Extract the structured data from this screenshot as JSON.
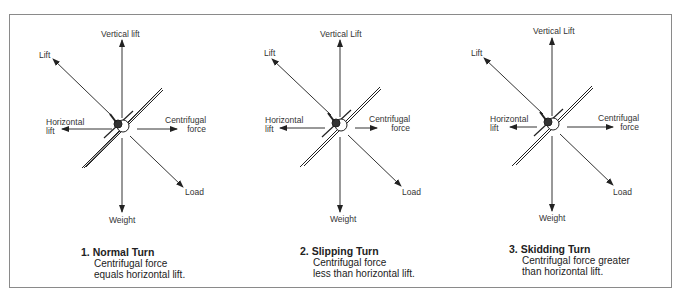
{
  "panels": [
    {
      "number": "1.",
      "title": "Normal Turn",
      "desc1": "Centrifugal force",
      "desc2": "equals horizontal lift.",
      "labels": {
        "vertical": "Vertical lift",
        "lift": "Lift",
        "h1": "Horizontal",
        "h2": "lift",
        "c1": "Centrifugal",
        "c2": "force",
        "load": "Load",
        "weight": "Weight"
      }
    },
    {
      "number": "2.",
      "title": "Slipping Turn",
      "desc1": "Centrifugal force",
      "desc2": "less than horizontal lift.",
      "labels": {
        "vertical": "Vertical Lift",
        "lift": "Lift",
        "h1": "Horizontal",
        "h2": "lift",
        "c1": "Centrifugal",
        "c2": "force",
        "load": "Load",
        "weight": "Weight"
      }
    },
    {
      "number": "3.",
      "title": "Skidding Turn",
      "desc1": "Centrifugal force greater",
      "desc2": "than horizontal lift.",
      "labels": {
        "vertical": "Vertical Lift",
        "lift": "Lift",
        "h1": "Horizontal",
        "h2": "lift",
        "c1": "Centrifugal",
        "c2": "force",
        "load": "Load",
        "weight": "Weight"
      }
    }
  ]
}
